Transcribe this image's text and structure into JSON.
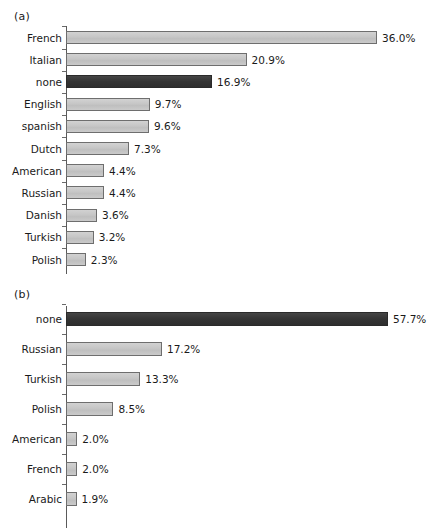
{
  "figure": {
    "panel_a_label": "(a)",
    "panel_b_label": "(b)"
  },
  "chart_data": [
    {
      "type": "bar",
      "orientation": "horizontal",
      "panel": "(a)",
      "title": "",
      "subtitle": "",
      "xlabel": "",
      "ylabel": "",
      "grid": false,
      "legend": "none",
      "xlim": [
        0,
        40
      ],
      "value_suffix": "%",
      "categories": [
        "French",
        "Italian",
        "none",
        "English",
        "spanish",
        "Dutch",
        "American",
        "Russian",
        "Danish",
        "Turkish",
        "Polish"
      ],
      "values": [
        36.0,
        20.9,
        16.9,
        9.7,
        9.6,
        7.3,
        4.4,
        4.4,
        3.6,
        3.2,
        2.3
      ],
      "data_labels": [
        "36.0%",
        "20.9%",
        "16.9%",
        "9.7%",
        "9.6%",
        "7.3%",
        "4.4%",
        "4.4%",
        "3.6%",
        "3.2%",
        "2.3%"
      ],
      "highlight_category": "none",
      "colors": {
        "bar": "#c9c9c9",
        "bar_border": "#6e6e6e",
        "bar_highlight": "#3a3a3a",
        "axis": "#5a5a5a",
        "text": "#1a1a1a"
      }
    },
    {
      "type": "bar",
      "orientation": "horizontal",
      "panel": "(b)",
      "title": "",
      "subtitle": "",
      "xlabel": "",
      "ylabel": "",
      "grid": false,
      "legend": "none",
      "xlim": [
        0,
        60
      ],
      "value_suffix": "%",
      "categories": [
        "none",
        "Russian",
        "Turkish",
        "Polish",
        "American",
        "French",
        "Arabic"
      ],
      "values": [
        57.7,
        17.2,
        13.3,
        8.5,
        2.0,
        2.0,
        1.9
      ],
      "data_labels": [
        "57.7%",
        "17.2%",
        "13.3%",
        "8.5%",
        "2.0%",
        "2.0%",
        "1.9%"
      ],
      "highlight_category": "none",
      "colors": {
        "bar": "#c9c9c9",
        "bar_border": "#6e6e6e",
        "bar_highlight": "#3a3a3a",
        "axis": "#5a5a5a",
        "text": "#1a1a1a"
      }
    }
  ]
}
